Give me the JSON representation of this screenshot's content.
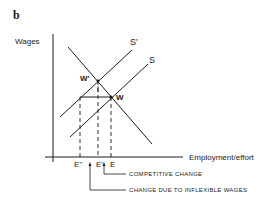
{
  "figure": {
    "panel_label": "b",
    "y_axis_label": "Wages",
    "x_axis_label": "Employment/effort",
    "curves": {
      "supply_shifted": "S'",
      "supply": "S"
    },
    "points": {
      "w_prime": "W'",
      "w": "W"
    },
    "x_ticks": {
      "e_double_prime": "E''",
      "e_prime": "E'",
      "e": "E"
    },
    "annotations": {
      "competitive_change": "COMPETITIVE CHANGE",
      "inflexible_change": "CHANGE DUE TO INFLEXIBLE WAGES"
    },
    "colors": {
      "ink": "#1a1a1a",
      "background": "#ffffff"
    }
  }
}
